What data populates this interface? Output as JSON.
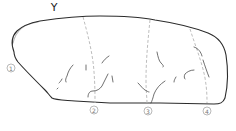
{
  "figure": {
    "view_label": "Y",
    "markers": [
      {
        "id": "1",
        "label": "1",
        "x": 11,
        "y": 68
      },
      {
        "id": "2",
        "label": "2",
        "x": 94,
        "y": 110
      },
      {
        "id": "3",
        "label": "3",
        "x": 148,
        "y": 111
      },
      {
        "id": "4",
        "label": "4",
        "x": 207,
        "y": 111
      }
    ],
    "colors": {
      "outline": "#2b2b2b",
      "section_lines": "#b5b5b5",
      "cracks": "#333333",
      "markers": "#8a8a8a"
    }
  }
}
